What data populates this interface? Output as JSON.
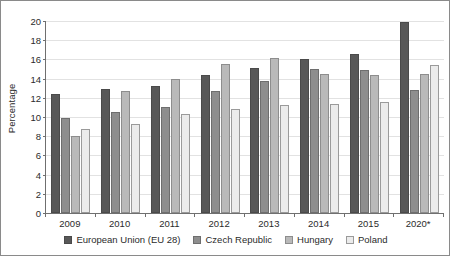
{
  "chart_data": {
    "type": "bar",
    "title": "",
    "xlabel": "",
    "ylabel": "Percentage",
    "ylim": [
      0,
      20
    ],
    "ytick_step": 2,
    "yticks": [
      0,
      2,
      4,
      6,
      8,
      10,
      12,
      14,
      16,
      18,
      20
    ],
    "grid": true,
    "legend_position": "bottom",
    "categories": [
      "2009",
      "2010",
      "2011",
      "2012",
      "2013",
      "2014",
      "2015",
      "2020*"
    ],
    "series": [
      {
        "name": "European Union (EU 28)",
        "color": "#585858",
        "values": [
          12.4,
          12.9,
          13.2,
          14.4,
          15.1,
          16.0,
          16.6,
          19.9
        ]
      },
      {
        "name": "Czech Republic",
        "color": "#8e8e8e",
        "values": [
          9.9,
          10.5,
          11.0,
          12.7,
          13.7,
          15.0,
          14.9,
          12.8
        ]
      },
      {
        "name": "Hungary",
        "color": "#b9b9b9",
        "values": [
          8.0,
          12.7,
          14.0,
          15.5,
          16.1,
          14.5,
          14.4,
          14.5
        ]
      },
      {
        "name": "Poland",
        "color": "#ebebeb",
        "values": [
          8.7,
          9.3,
          10.3,
          10.8,
          11.3,
          11.4,
          11.6,
          15.4
        ]
      }
    ]
  }
}
